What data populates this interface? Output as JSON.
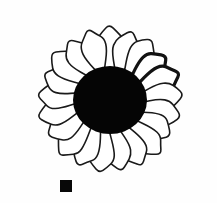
{
  "figure": {
    "title": "Daisy flower line drawing",
    "background_color": "#fefefe",
    "width": 217,
    "height": 203,
    "style": "scanned black-and-white line art"
  },
  "flower": {
    "name": "daisy-flower-head",
    "center_x": 110,
    "center_y": 100,
    "disc": {
      "name": "central-disc",
      "color": "#050505",
      "radius_x": 37,
      "radius_y": 34,
      "description": "solid black central disc florets"
    },
    "petals": {
      "count": 21,
      "fill_color": "#ffffff",
      "outline_color": "#1a1a1a",
      "inner_radius": 30,
      "outer_radius": 96,
      "petal_half_width": 13,
      "heavy_outline_indices": [
        3,
        4
      ],
      "angles_deg": [
        -90,
        -72.9,
        -55.7,
        -38.6,
        -21.4,
        -4.3,
        12.9,
        30,
        47.1,
        64.3,
        81.4,
        98.6,
        115.7,
        132.9,
        150,
        167.1,
        184.3,
        201.4,
        218.6,
        235.7,
        252.9
      ],
      "radial_lengths": [
        92,
        88,
        90,
        86,
        92,
        90,
        88,
        84,
        90,
        88,
        86,
        90,
        88,
        92,
        86,
        90,
        88,
        86,
        92,
        88,
        90
      ]
    }
  },
  "scale_marker": {
    "name": "scale-bar-square",
    "shape": "square",
    "color": "#080808",
    "x": 60,
    "y": 180,
    "size": 12
  }
}
